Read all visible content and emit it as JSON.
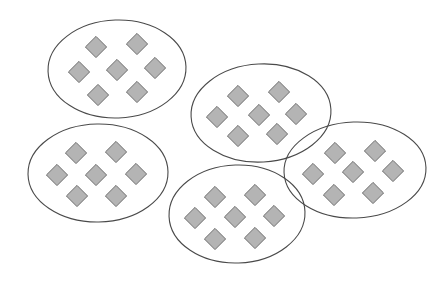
{
  "figure": {
    "type": "set-diagram",
    "canvas": {
      "width": 437,
      "height": 281,
      "background": "#ffffff"
    },
    "style": {
      "ellipse_stroke": "#4a4a4a",
      "ellipse_stroke_width": 1.1,
      "ellipse_fill": "none",
      "diamond_fill": "#b4b4b4",
      "diamond_stroke": "#6b6b6b",
      "diamond_stroke_width": 1,
      "diamond_size": 15
    },
    "totals": {
      "group_count": 5,
      "items_per_group": 7,
      "item_total": 35,
      "item_shape": "diamond"
    },
    "groups": [
      {
        "id": "group-1",
        "label": "top-left-group",
        "position": "top-left",
        "cx": 117,
        "cy": 69,
        "rx": 69,
        "ry": 49,
        "rotation": -2,
        "item_count": 7,
        "items": [
          {
            "id": "g1-d1",
            "x": 96,
            "y": 47
          },
          {
            "id": "g1-d2",
            "x": 137,
            "y": 44
          },
          {
            "id": "g1-d3",
            "x": 79,
            "y": 72
          },
          {
            "id": "g1-d4",
            "x": 117,
            "y": 70
          },
          {
            "id": "g1-d5",
            "x": 155,
            "y": 68
          },
          {
            "id": "g1-d6",
            "x": 98,
            "y": 95
          },
          {
            "id": "g1-d7",
            "x": 137,
            "y": 92
          }
        ]
      },
      {
        "id": "group-2",
        "label": "top-middle-group",
        "position": "top-middle",
        "cx": 261,
        "cy": 113,
        "rx": 70,
        "ry": 49,
        "rotation": -3,
        "item_count": 7,
        "items": [
          {
            "id": "g2-d1",
            "x": 238,
            "y": 96
          },
          {
            "id": "g2-d2",
            "x": 279,
            "y": 92
          },
          {
            "id": "g2-d3",
            "x": 217,
            "y": 117
          },
          {
            "id": "g2-d4",
            "x": 259,
            "y": 115
          },
          {
            "id": "g2-d5",
            "x": 296,
            "y": 114
          },
          {
            "id": "g2-d6",
            "x": 238,
            "y": 136
          },
          {
            "id": "g2-d7",
            "x": 277,
            "y": 134
          }
        ]
      },
      {
        "id": "group-3",
        "label": "bottom-left-group",
        "position": "bottom-left",
        "cx": 98,
        "cy": 173,
        "rx": 70,
        "ry": 49,
        "rotation": -1,
        "item_count": 7,
        "items": [
          {
            "id": "g3-d1",
            "x": 76,
            "y": 153
          },
          {
            "id": "g3-d2",
            "x": 116,
            "y": 152
          },
          {
            "id": "g3-d3",
            "x": 57,
            "y": 175
          },
          {
            "id": "g3-d4",
            "x": 96,
            "y": 175
          },
          {
            "id": "g3-d5",
            "x": 136,
            "y": 174
          },
          {
            "id": "g3-d6",
            "x": 77,
            "y": 196
          },
          {
            "id": "g3-d7",
            "x": 116,
            "y": 196
          }
        ]
      },
      {
        "id": "group-4",
        "label": "bottom-middle-group",
        "position": "bottom-middle",
        "cx": 237,
        "cy": 214,
        "rx": 68,
        "ry": 49,
        "rotation": -2,
        "item_count": 7,
        "items": [
          {
            "id": "g4-d1",
            "x": 215,
            "y": 197
          },
          {
            "id": "g4-d2",
            "x": 255,
            "y": 195
          },
          {
            "id": "g4-d3",
            "x": 195,
            "y": 218
          },
          {
            "id": "g4-d4",
            "x": 235,
            "y": 217
          },
          {
            "id": "g4-d5",
            "x": 274,
            "y": 216
          },
          {
            "id": "g4-d6",
            "x": 215,
            "y": 239
          },
          {
            "id": "g4-d7",
            "x": 255,
            "y": 238
          }
        ]
      },
      {
        "id": "group-5",
        "label": "right-group",
        "position": "right",
        "cx": 355,
        "cy": 170,
        "rx": 71,
        "ry": 48,
        "rotation": -2,
        "item_count": 7,
        "items": [
          {
            "id": "g5-d1",
            "x": 335,
            "y": 153
          },
          {
            "id": "g5-d2",
            "x": 375,
            "y": 151
          },
          {
            "id": "g5-d3",
            "x": 313,
            "y": 174
          },
          {
            "id": "g5-d4",
            "x": 353,
            "y": 172
          },
          {
            "id": "g5-d5",
            "x": 393,
            "y": 171
          },
          {
            "id": "g5-d6",
            "x": 334,
            "y": 195
          },
          {
            "id": "g5-d7",
            "x": 373,
            "y": 193
          }
        ]
      }
    ]
  }
}
